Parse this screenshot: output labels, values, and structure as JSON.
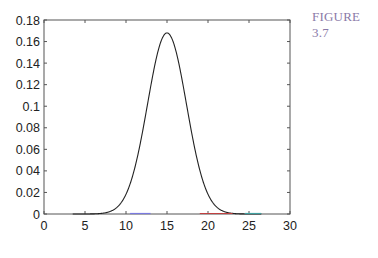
{
  "figure_label": "FIGURE 3.7",
  "chart_data": {
    "type": "line",
    "title": "",
    "xlabel": "",
    "ylabel": "",
    "xlim": [
      0,
      30
    ],
    "ylim": [
      0,
      0.18
    ],
    "grid": false,
    "legend": null,
    "x_ticks": [
      0,
      5,
      10,
      15,
      20,
      25,
      30
    ],
    "x_tick_labels": [
      "0",
      "5",
      "10",
      "15",
      "20",
      "25",
      "30"
    ],
    "y_ticks": [
      0,
      0.02,
      0.04,
      0.06,
      0.08,
      0.1,
      0.12,
      0.14,
      0.16,
      0.18
    ],
    "y_tick_labels": [
      "0",
      "0.02",
      "0 04",
      "0.06",
      "0.08",
      "0.1",
      "0.12",
      "0.14",
      "0.16",
      "0.18"
    ],
    "series": [
      {
        "name": "gaussian",
        "color": "#222222",
        "x": [
          3.5,
          8,
          9,
          10,
          10.5,
          11,
          11.5,
          12,
          12.5,
          13,
          13.5,
          14,
          14.5,
          15,
          15.5,
          16,
          16.5,
          17,
          17.5,
          18,
          18.5,
          19,
          19.5,
          20,
          21,
          22,
          26.5
        ],
        "y": [
          0,
          0.0002,
          0.0007,
          0.0018,
          0.0028,
          0.0068,
          0.0155,
          0.0333,
          0.0569,
          0.0857,
          0.1177,
          0.1455,
          0.1628,
          0.168,
          0.1628,
          0.1455,
          0.1177,
          0.0857,
          0.0569,
          0.0333,
          0.0155,
          0.0068,
          0.0028,
          0.0011,
          0.0002,
          0.0,
          0
        ]
      },
      {
        "name": "baseline-blue",
        "color": "#7a7ae0",
        "x": [
          10.5,
          13
        ],
        "y": [
          0,
          0
        ]
      },
      {
        "name": "baseline-red",
        "color": "#c04040",
        "x": [
          19,
          23
        ],
        "y": [
          0,
          0
        ]
      },
      {
        "name": "baseline-cyan",
        "color": "#40a0a0",
        "x": [
          24.5,
          26.5
        ],
        "y": [
          0,
          0
        ]
      }
    ],
    "peak": {
      "x": 15,
      "y": 0.168
    }
  }
}
